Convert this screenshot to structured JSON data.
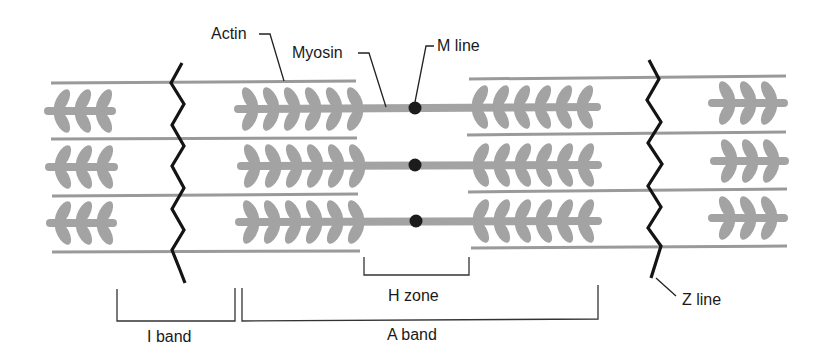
{
  "diagram": {
    "colors": {
      "filament": "#a3a3a3",
      "actin_line": "#9a9a9a",
      "z_line": "#141414",
      "m_line_dot": "#1c1c1c",
      "bracket": "#333333",
      "text": "#1a1a1a",
      "background": "#ffffff"
    },
    "labels": {
      "actin": "Actin",
      "myosin": "Myosin",
      "m_line": "M line",
      "h_zone": "H zone",
      "i_band": "I band",
      "a_band": "A band",
      "z_line": "Z line"
    },
    "rows": [
      {
        "rod_y": 108
      },
      {
        "rod_y": 165
      },
      {
        "rod_y": 221
      }
    ],
    "groups": [
      {
        "name": "far-left-myosin",
        "head_count": 3,
        "direction": "left"
      },
      {
        "name": "center-left-myosin",
        "head_count": 6,
        "direction": "right"
      },
      {
        "name": "center-right-myosin",
        "head_count": 6,
        "direction": "left"
      },
      {
        "name": "far-right-myosin",
        "head_count": 3,
        "direction": "right"
      }
    ]
  }
}
